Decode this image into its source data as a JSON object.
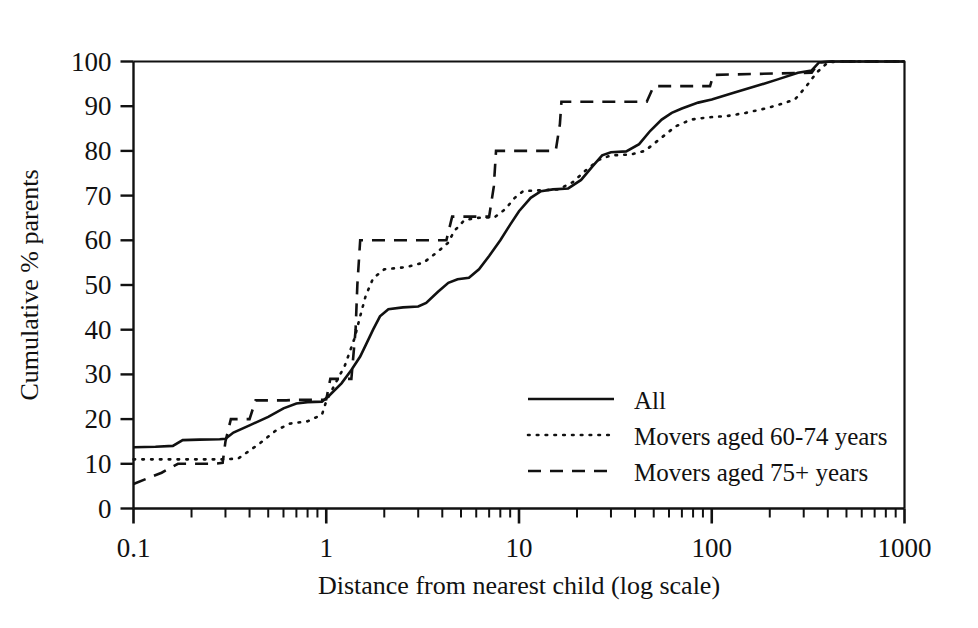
{
  "chart_data": {
    "type": "line",
    "title": "",
    "xlabel": "Distance from nearest child (log scale)",
    "ylabel": "Cumulative % parents",
    "xscale": "log",
    "xlim": [
      0.1,
      1000
    ],
    "ylim": [
      0,
      100
    ],
    "grid": false,
    "legend_position": "inside-right-lower",
    "x_tick_labels": [
      "0.1",
      "1",
      "10",
      "100",
      "1000"
    ],
    "x_tick_values": [
      0.1,
      1,
      10,
      100,
      1000
    ],
    "y_tick_labels": [
      "0",
      "10",
      "20",
      "30",
      "40",
      "50",
      "60",
      "70",
      "80",
      "90",
      "100"
    ],
    "y_tick_values": [
      0,
      10,
      20,
      30,
      40,
      50,
      60,
      70,
      80,
      90,
      100
    ],
    "series": [
      {
        "name": "All",
        "style": "solid",
        "color": "#111111",
        "points": [
          [
            0.1,
            13.7
          ],
          [
            0.13,
            13.8
          ],
          [
            0.16,
            14.0
          ],
          [
            0.18,
            15.3
          ],
          [
            0.22,
            15.4
          ],
          [
            0.28,
            15.5
          ],
          [
            0.3,
            15.6
          ],
          [
            0.33,
            17.0
          ],
          [
            0.4,
            18.6
          ],
          [
            0.5,
            20.5
          ],
          [
            0.6,
            22.4
          ],
          [
            0.7,
            23.5
          ],
          [
            0.8,
            23.8
          ],
          [
            0.95,
            23.9
          ],
          [
            1.05,
            25.5
          ],
          [
            1.2,
            28.0
          ],
          [
            1.35,
            31.0
          ],
          [
            1.5,
            34.0
          ],
          [
            1.6,
            36.5
          ],
          [
            1.75,
            40.0
          ],
          [
            1.9,
            43.0
          ],
          [
            2.1,
            44.6
          ],
          [
            2.5,
            45.0
          ],
          [
            3.0,
            45.2
          ],
          [
            3.3,
            46.0
          ],
          [
            3.8,
            48.5
          ],
          [
            4.3,
            50.5
          ],
          [
            4.8,
            51.3
          ],
          [
            5.5,
            51.6
          ],
          [
            6.2,
            53.5
          ],
          [
            7.0,
            56.5
          ],
          [
            8.0,
            60.0
          ],
          [
            9.0,
            63.5
          ],
          [
            10.0,
            66.5
          ],
          [
            11.5,
            69.5
          ],
          [
            13.0,
            71.0
          ],
          [
            15.0,
            71.4
          ],
          [
            18.0,
            71.6
          ],
          [
            21.0,
            73.5
          ],
          [
            24.0,
            76.5
          ],
          [
            27.0,
            79.0
          ],
          [
            30.0,
            79.7
          ],
          [
            36.0,
            79.9
          ],
          [
            42.0,
            81.5
          ],
          [
            48.0,
            84.5
          ],
          [
            55.0,
            87.0
          ],
          [
            62.0,
            88.5
          ],
          [
            70.0,
            89.5
          ],
          [
            85.0,
            90.8
          ],
          [
            100.0,
            91.5
          ],
          [
            130.0,
            93.0
          ],
          [
            170.0,
            94.5
          ],
          [
            220.0,
            96.0
          ],
          [
            280.0,
            97.5
          ],
          [
            330.0,
            98.0
          ],
          [
            360.0,
            99.8
          ],
          [
            420.0,
            100.0
          ],
          [
            1000.0,
            100.0
          ]
        ]
      },
      {
        "name": "Movers aged 60-74 years",
        "style": "dotted",
        "color": "#111111",
        "points": [
          [
            0.1,
            11.0
          ],
          [
            0.3,
            11.0
          ],
          [
            0.35,
            11.2
          ],
          [
            0.45,
            14.5
          ],
          [
            0.55,
            17.5
          ],
          [
            0.65,
            19.0
          ],
          [
            0.8,
            19.5
          ],
          [
            0.95,
            21.0
          ],
          [
            1.0,
            24.0
          ],
          [
            1.1,
            27.5
          ],
          [
            1.25,
            32.0
          ],
          [
            1.4,
            38.0
          ],
          [
            1.5,
            43.0
          ],
          [
            1.6,
            47.5
          ],
          [
            1.75,
            51.5
          ],
          [
            2.0,
            53.5
          ],
          [
            2.6,
            54.0
          ],
          [
            3.2,
            55.0
          ],
          [
            3.8,
            57.5
          ],
          [
            4.3,
            59.5
          ],
          [
            4.6,
            62.0
          ],
          [
            5.2,
            64.5
          ],
          [
            6.0,
            65.0
          ],
          [
            7.5,
            65.2
          ],
          [
            8.5,
            67.0
          ],
          [
            9.5,
            69.5
          ],
          [
            10.5,
            71.0
          ],
          [
            13.0,
            71.2
          ],
          [
            16.0,
            71.4
          ],
          [
            19.0,
            73.0
          ],
          [
            22.0,
            75.5
          ],
          [
            26.0,
            78.0
          ],
          [
            30.0,
            79.0
          ],
          [
            38.0,
            79.2
          ],
          [
            45.0,
            80.0
          ],
          [
            55.0,
            83.0
          ],
          [
            65.0,
            85.5
          ],
          [
            78.0,
            87.0
          ],
          [
            95.0,
            87.5
          ],
          [
            120.0,
            87.8
          ],
          [
            150.0,
            88.5
          ],
          [
            190.0,
            89.5
          ],
          [
            230.0,
            90.5
          ],
          [
            270.0,
            91.5
          ],
          [
            310.0,
            94.5
          ],
          [
            350.0,
            97.5
          ],
          [
            400.0,
            99.8
          ],
          [
            450.0,
            100.0
          ],
          [
            1000.0,
            100.0
          ]
        ]
      },
      {
        "name": "Movers aged 75+ years",
        "style": "dashed",
        "color": "#111111",
        "points": [
          [
            0.1,
            5.5
          ],
          [
            0.14,
            8.0
          ],
          [
            0.17,
            10.0
          ],
          [
            0.26,
            10.0
          ],
          [
            0.29,
            10.2
          ],
          [
            0.3,
            15.0
          ],
          [
            0.32,
            20.0
          ],
          [
            0.4,
            20.0
          ],
          [
            0.43,
            24.2
          ],
          [
            0.62,
            24.2
          ],
          [
            0.7,
            24.3
          ],
          [
            0.95,
            24.3
          ],
          [
            1.0,
            24.4
          ],
          [
            1.05,
            29.0
          ],
          [
            1.35,
            29.0
          ],
          [
            1.42,
            40.0
          ],
          [
            1.45,
            50.0
          ],
          [
            1.5,
            60.0
          ],
          [
            4.2,
            60.0
          ],
          [
            4.5,
            65.3
          ],
          [
            7.0,
            65.3
          ],
          [
            7.4,
            72.0
          ],
          [
            7.6,
            80.0
          ],
          [
            15.5,
            80.0
          ],
          [
            16.3,
            86.0
          ],
          [
            16.6,
            91.0
          ],
          [
            46.0,
            91.0
          ],
          [
            50.0,
            94.5
          ],
          [
            98.0,
            94.5
          ],
          [
            102.0,
            97.0
          ],
          [
            330.0,
            97.5
          ],
          [
            360.0,
            99.8
          ],
          [
            420.0,
            100.0
          ],
          [
            1000.0,
            100.0
          ]
        ]
      }
    ]
  },
  "legend": {
    "entries": [
      {
        "label": "All",
        "style": "solid"
      },
      {
        "label": "Movers aged 60-74 years",
        "style": "dotted"
      },
      {
        "label": "Movers aged 75+ years",
        "style": "dashed"
      }
    ]
  }
}
